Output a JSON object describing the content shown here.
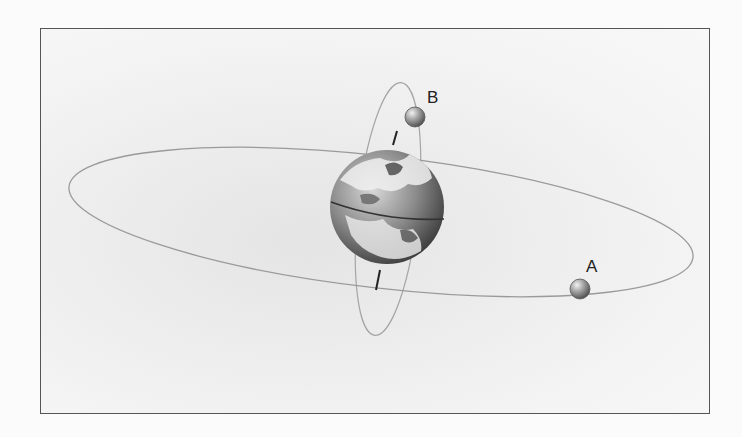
{
  "diagram": {
    "type": "orbit-diagram",
    "central_body": "earth",
    "satellites": [
      {
        "label": "A",
        "orbit": "equatorial"
      },
      {
        "label": "B",
        "orbit": "polar"
      }
    ],
    "colors": {
      "frame_border": "#555555",
      "orbit_line": "#9a9a9a",
      "axis_line": "#222222",
      "satellite": "#8c8c8c"
    }
  }
}
